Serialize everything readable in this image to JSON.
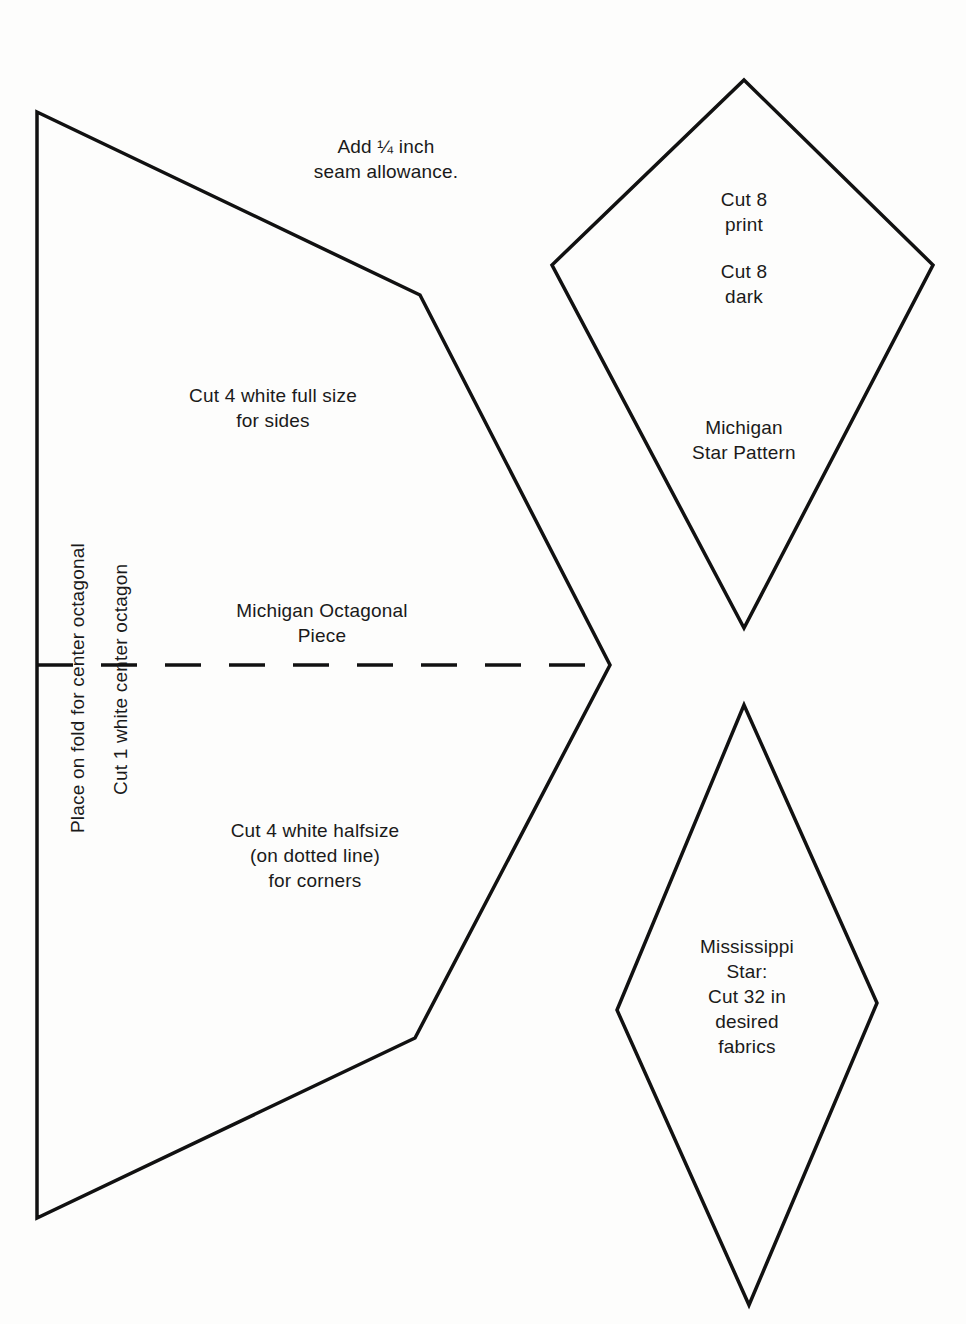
{
  "page": {
    "background": "#fdfdfc",
    "line_color": "#111111"
  },
  "notes": {
    "seam_allowance": [
      "Add ¼ inch",
      "seam allowance."
    ]
  },
  "octagonal_piece": {
    "title": [
      "Michigan Octagonal",
      "Piece"
    ],
    "full_size_instruction": [
      "Cut 4 white full size",
      "for sides"
    ],
    "half_size_instruction": [
      "Cut 4 white halfsize",
      "(on dotted line)",
      "for corners"
    ],
    "fold_instruction": "Place on fold for center octagonal",
    "center_instruction": "Cut 1 white center octagon",
    "vertices": [
      [
        37,
        112
      ],
      [
        420,
        295
      ],
      [
        610,
        665
      ],
      [
        415,
        1038
      ],
      [
        37,
        1218
      ]
    ],
    "dashed_fold_line": {
      "y": 665,
      "x1": 37,
      "x2": 605
    }
  },
  "michigan_star": {
    "instruction_print": [
      "Cut 8",
      "print"
    ],
    "instruction_dark": [
      "Cut 8",
      "dark"
    ],
    "title": [
      "Michigan",
      "Star Pattern"
    ],
    "vertices": [
      [
        744,
        80
      ],
      [
        933,
        265
      ],
      [
        744,
        628
      ],
      [
        552,
        265
      ]
    ]
  },
  "mississippi_star": {
    "text": [
      "Mississippi",
      "Star:",
      "Cut 32 in",
      "desired",
      "fabrics"
    ],
    "vertices": [
      [
        744,
        705
      ],
      [
        877,
        1003
      ],
      [
        749,
        1305
      ],
      [
        617,
        1010
      ]
    ]
  }
}
